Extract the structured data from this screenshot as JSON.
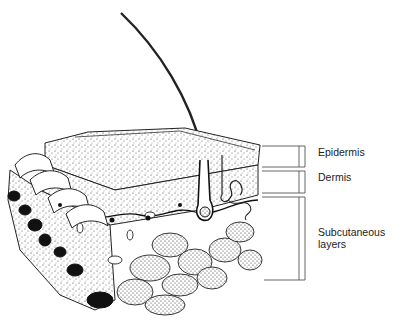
{
  "diagram": {
    "labels": [
      {
        "id": "epidermis",
        "text": "Epidermis",
        "x": 318,
        "y": 151
      },
      {
        "id": "dermis",
        "text": "Dermis",
        "x": 318,
        "y": 176
      },
      {
        "id": "subcutaneous",
        "text": "Subcutaneous",
        "x": 318,
        "y": 231
      },
      {
        "id": "subcutaneous2",
        "text": "layers",
        "x": 318,
        "y": 243
      }
    ],
    "brackets": [
      {
        "id": "epidermis",
        "top": 146,
        "bottom": 167
      },
      {
        "id": "dermis",
        "top": 171,
        "bottom": 193
      },
      {
        "id": "subcutaneous",
        "top": 197,
        "bottom": 280
      }
    ],
    "colors": {
      "ink": "#1a1a1a",
      "line": "#555555",
      "paper": "#ffffff"
    }
  }
}
